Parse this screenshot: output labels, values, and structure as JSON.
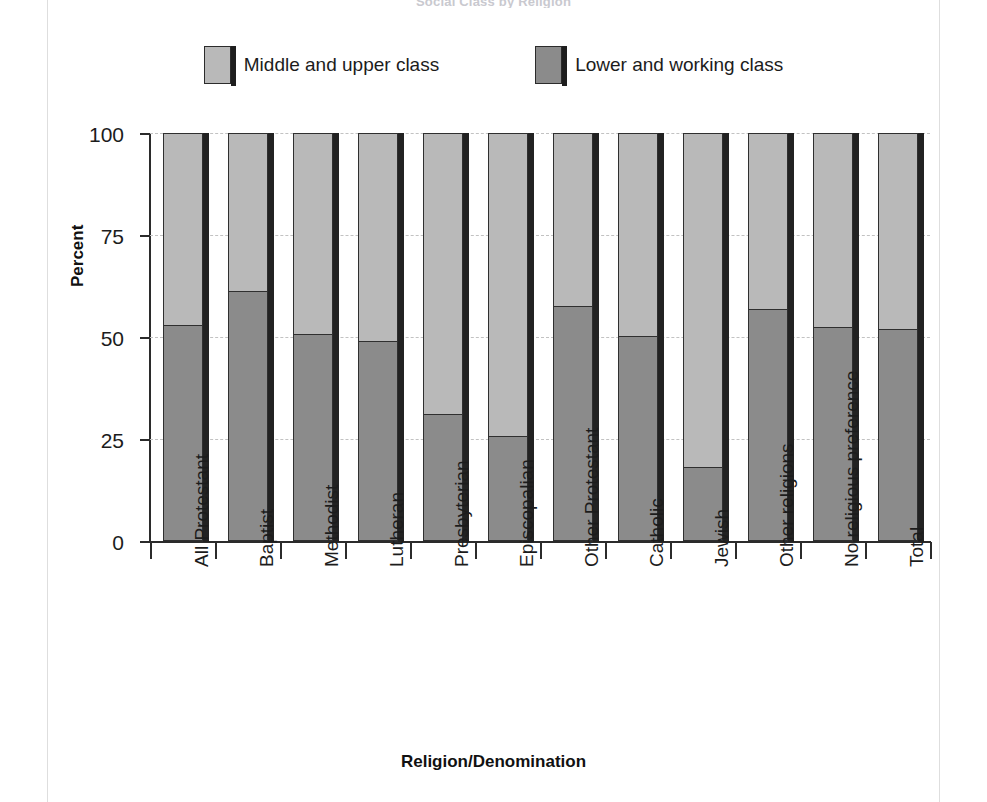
{
  "clipped_title": "Social Class by Religion",
  "legend": {
    "items": [
      {
        "label": "Middle and upper class",
        "color": "#b9b9b9",
        "icon": "legend-swatch-upper"
      },
      {
        "label": "Lower and working class",
        "color": "#8b8b8b",
        "icon": "legend-swatch-lower"
      }
    ]
  },
  "axes": {
    "y_title": "Percent",
    "x_title": "Religion/Denomination",
    "y_ticks": [
      "0",
      "25",
      "50",
      "75",
      "100"
    ]
  },
  "chart_data": {
    "type": "bar",
    "title": "Social Class by Religion",
    "xlabel": "Religion/Denomination",
    "ylabel": "Percent",
    "ylim": [
      0,
      100
    ],
    "yticks": [
      0,
      25,
      50,
      75,
      100
    ],
    "grid": true,
    "stacked": true,
    "legend_position": "top-center",
    "categories": [
      "All Protestant",
      "Baptist",
      "Methodist",
      "Lutheran",
      "Presbyterian",
      "Episcopalian",
      "Other Protestant",
      "Catholic",
      "Jewish",
      "Other religions",
      "No religious preference",
      "Total"
    ],
    "series": [
      {
        "name": "Lower and working class",
        "color": "#8b8b8b",
        "values": [
          52.7,
          61.0,
          50.5,
          48.8,
          31.0,
          25.5,
          57.3,
          50.0,
          18.0,
          56.5,
          52.3,
          51.6
        ]
      },
      {
        "name": "Middle and upper class",
        "color": "#b9b9b9",
        "values": [
          47.3,
          39.0,
          49.5,
          51.2,
          69.0,
          74.5,
          42.7,
          50.0,
          82.0,
          43.5,
          47.7,
          48.4
        ]
      }
    ]
  }
}
